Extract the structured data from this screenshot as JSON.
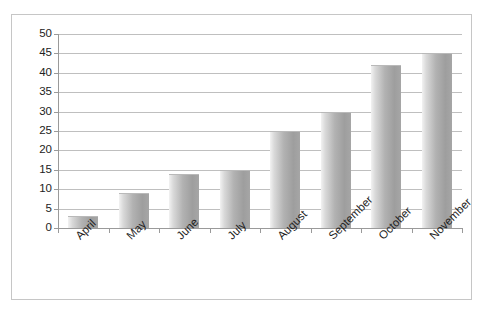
{
  "chart_data": {
    "type": "bar",
    "title": "",
    "subtitle": "",
    "xlabel": "",
    "ylabel": "",
    "categories": [
      "April",
      "May",
      "June",
      "July",
      "August",
      "September",
      "October",
      "November"
    ],
    "values": [
      3,
      9,
      14,
      15,
      25,
      30,
      42,
      45
    ],
    "series": [
      {
        "name": "Series 1",
        "values": [
          3,
          9,
          14,
          15,
          25,
          30,
          42,
          45
        ]
      }
    ],
    "ylim": [
      0,
      50
    ],
    "ytick_step": 5,
    "yticks": [
      0,
      5,
      10,
      15,
      20,
      25,
      30,
      35,
      40,
      45,
      50
    ],
    "ytick_labels": [
      "0",
      "5",
      "10",
      "15",
      "20",
      "25",
      "30",
      "35",
      "40",
      "45",
      "50"
    ],
    "grid": "horizontal",
    "legend": "none",
    "annotations": [],
    "xtick_label_rotation": -45,
    "colors": {
      "bar_light": "#f2f2f2",
      "bar_mid": "#b2b2b2",
      "bar_dark": "#9e9e9e",
      "gridline": "#bfbfbf",
      "axis": "#9a9a9a",
      "border": "#c6c6c6",
      "background": "#ffffff",
      "text": "#1f1f1f"
    }
  }
}
